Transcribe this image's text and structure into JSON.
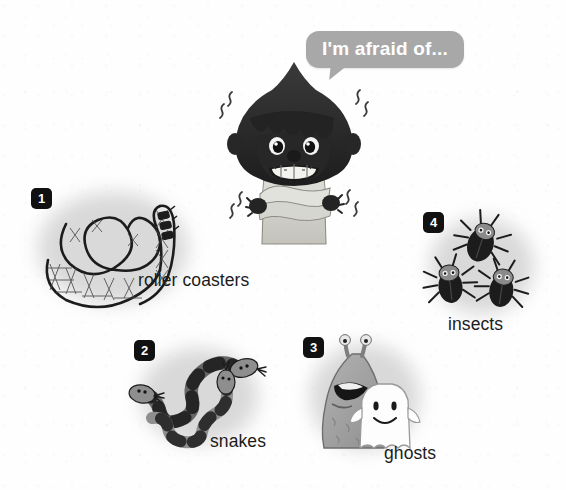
{
  "page": {
    "title": "I'm afraid of...",
    "background_color": "#fefefe",
    "text_color": "#1c1c1c",
    "badge_color": "#111111",
    "bubble_color": "#a8a8a8"
  },
  "speech_bubble": {
    "text": "I'm afraid of...",
    "speaker": "scared-character"
  },
  "character": {
    "name": "scared-character",
    "description": "boy with dark bowl-cut hair hugging himself, trembling, gritted teeth",
    "hair_color": "#2b2b2b",
    "shirt_color": "#d2d2cc"
  },
  "items": [
    {
      "number": "1",
      "label": "roller coasters",
      "icon": "roller-coaster-icon"
    },
    {
      "number": "2",
      "label": "snakes",
      "icon": "snakes-icon"
    },
    {
      "number": "3",
      "label": "ghosts",
      "icon": "ghosts-icon"
    },
    {
      "number": "4",
      "label": "insects",
      "icon": "insects-icon"
    }
  ]
}
